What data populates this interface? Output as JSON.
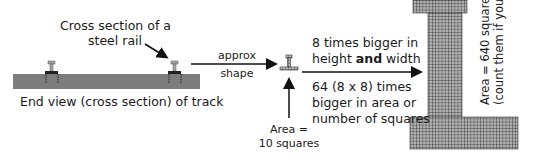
{
  "labels": {
    "rail_caption_line1": "Cross section of a",
    "rail_caption_line2": "steel rail",
    "track_caption": "End view (cross section) of track",
    "arrow_label_top": "approx",
    "arrow_label_bottom": "shape",
    "small_area_line1": "Area =",
    "small_area_line2": "10 squares",
    "scale_line1": "8 times bigger in",
    "scale_line2_pre": "height ",
    "scale_line2_bold": "and",
    "scale_line2_post": " width",
    "area_line1": "64 (8 x 8) times",
    "area_line2": "bigger in area or",
    "area_line3": "number of squares",
    "big_area_line1": "Area = 640 squares",
    "big_area_line2": "(count them if you like)"
  },
  "colors": {
    "track": "#7a7a7a",
    "rail": "#9a9a9a",
    "grid_fill": "#a8a8a8",
    "grid_line": "#3a3a3a",
    "arrow": "#111111"
  },
  "small_shape": {
    "squares": 10
  },
  "big_shape": {
    "squares": 640,
    "scale_factor": 8,
    "area_factor": 64
  }
}
